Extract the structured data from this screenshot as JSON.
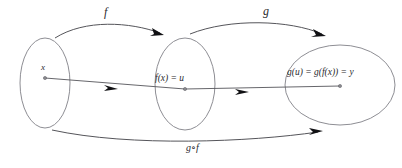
{
  "figure": {
    "background_color": "#ffffff",
    "ellipse_stroke": "#8e8e94",
    "curve_stroke": "#55555a",
    "arrow_fill": "#111114",
    "text_color": "#2a2a2e"
  },
  "labels": {
    "f_map": "f",
    "g_map": "g",
    "composition_map": "g∘f",
    "domain_element": "x",
    "intermediate_element": "f(x) = u",
    "codomain_element": "g(u) = g(f(x)) = y"
  },
  "sets": [
    {
      "name": "domain-set",
      "cx": 45,
      "cy": 83,
      "rx": 25,
      "ry": 45
    },
    {
      "name": "intermediate-set",
      "cx": 185,
      "cy": 84,
      "rx": 30,
      "ry": 46
    },
    {
      "name": "codomain-set",
      "cx": 340,
      "cy": 85,
      "rx": 55,
      "ry": 40
    }
  ],
  "elements": [
    {
      "name": "point-x",
      "cx": 45,
      "cy": 78
    },
    {
      "name": "point-u",
      "cx": 185,
      "cy": 89
    },
    {
      "name": "point-y",
      "cx": 340,
      "cy": 86
    }
  ],
  "arrows": [
    {
      "name": "f-arrow",
      "label": "f",
      "from": "domain-set",
      "to": "intermediate-set",
      "style": "curved-above"
    },
    {
      "name": "g-arrow",
      "label": "g",
      "from": "intermediate-set",
      "to": "codomain-set",
      "style": "curved-above"
    },
    {
      "name": "composition-arrow",
      "label": "g∘f",
      "from": "domain-set",
      "to": "codomain-set",
      "style": "curved-below"
    },
    {
      "name": "element-map-f",
      "label": "",
      "from": "point-x",
      "to": "point-u",
      "style": "straight"
    },
    {
      "name": "element-map-g",
      "label": "",
      "from": "point-u",
      "to": "point-y",
      "style": "straight"
    }
  ]
}
